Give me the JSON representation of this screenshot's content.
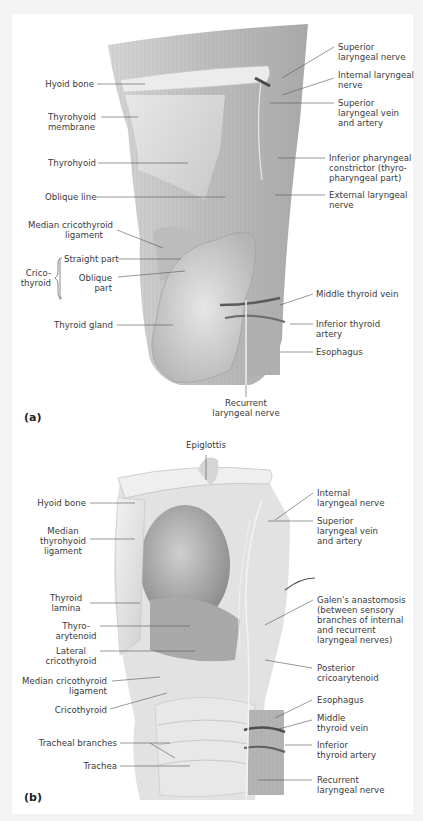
{
  "figure": {
    "panels": [
      {
        "id": "a",
        "tag": "(a)",
        "labels_left": {
          "hyoid_bone": "Hyoid bone",
          "thyrohyoid_membrane_1": "Thyrohyoid",
          "thyrohyoid_membrane_2": "membrane",
          "thyrohyoid": "Thyrohyoid",
          "oblique_line": "Oblique line",
          "median_cricothyroid_1": "Median cricothyroid",
          "median_cricothyroid_2": "ligament",
          "crico_1": "Crico-",
          "crico_2": "thyroid",
          "straight_part": "Straight part",
          "oblique_part_1": "Oblique",
          "oblique_part_2": "part",
          "thyroid_gland": "Thyroid gland"
        },
        "labels_right": {
          "superior_laryngeal_nerve_1": "Superior",
          "superior_laryngeal_nerve_2": "laryngeal nerve",
          "internal_laryngeal_nerve_1": "Internal laryngeal",
          "internal_laryngeal_nerve_2": "nerve",
          "sup_lar_vein_1": "Superior",
          "sup_lar_vein_2": "laryngeal vein",
          "sup_lar_vein_3": "and artery",
          "inf_phar_1": "Inferior pharyngeal",
          "inf_phar_2": "constrictor (thyro-",
          "inf_phar_3": "pharyngeal part)",
          "ext_lar_1": "External laryngeal",
          "ext_lar_2": "nerve",
          "middle_thyroid_vein": "Middle thyroid vein",
          "inf_thyroid_artery_1": "Inferior thyroid",
          "inf_thyroid_artery_2": "artery",
          "esophagus": "Esophagus"
        },
        "labels_bottom": {
          "recurrent_1": "Recurrent",
          "recurrent_2": "laryngeal nerve"
        }
      },
      {
        "id": "b",
        "tag": "(b)",
        "labels_top": {
          "epiglottis": "Epiglottis"
        },
        "labels_left": {
          "hyoid_bone": "Hyoid bone",
          "median_thyrohyoid_1": "Median",
          "median_thyrohyoid_2": "thyrohyoid",
          "median_thyrohyoid_3": "ligament",
          "thyroid_lamina_1": "Thyroid",
          "thyroid_lamina_2": "lamina",
          "thyroarytenoid_1": "Thyro-",
          "thyroarytenoid_2": "arytenoid",
          "lateral_crico_1": "Lateral",
          "lateral_crico_2": "cricothyroid",
          "median_crico_1": "Median cricothyroid",
          "median_crico_2": "ligament",
          "cricothyroid": "Cricothyroid",
          "tracheal_branches": "Tracheal branches",
          "trachea": "Trachea"
        },
        "labels_right": {
          "internal_lar_1": "Internal",
          "internal_lar_2": "laryngeal nerve",
          "sup_lar_vein_1": "Superior",
          "sup_lar_vein_2": "laryngeal vein",
          "sup_lar_vein_3": "and artery",
          "galen_1": "Galen's anastomosis",
          "galen_2": "(between sensory",
          "galen_3": "branches of internal",
          "galen_4": "and recurrent",
          "galen_5": "laryngeal nerves)",
          "post_crico_1": "Posterior",
          "post_crico_2": "cricoarytenoid",
          "esophagus": "Esophagus",
          "middle_thyroid_1": "Middle",
          "middle_thyroid_2": "thyroid vein",
          "inf_thyroid_1": "Inferior",
          "inf_thyroid_2": "thyroid artery",
          "recurrent_1": "Recurrent",
          "recurrent_2": "laryngeal nerve"
        }
      }
    ],
    "colors": {
      "background": "#f3f3f3",
      "panel": "#ffffff",
      "text": "#3a3a3a",
      "leader": "#555555"
    }
  }
}
